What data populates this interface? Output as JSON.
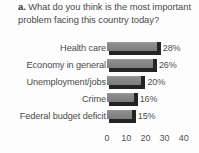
{
  "question": {
    "lead": "a.",
    "text": "What do you think is the most important problem facing this country today?"
  },
  "chart_data": {
    "type": "bar",
    "orientation": "horizontal",
    "title": "a. What do you think is the most important problem facing this country today?",
    "xlabel": "",
    "ylabel": "",
    "xlim": [
      0,
      40
    ],
    "xticks": [
      "0",
      "10",
      "20",
      "30",
      "40"
    ],
    "grid": false,
    "legend": false,
    "categories": [
      "Health care",
      "Economy in general",
      "Unemployment/jobs",
      "Crime",
      "Federal budget deficit"
    ],
    "values": [
      28,
      26,
      20,
      16,
      15
    ],
    "data_labels": [
      "28%",
      "26%",
      "20%",
      "16%",
      "15%"
    ],
    "bar_color": "#848484",
    "bar_shadow_color": "#242424"
  }
}
